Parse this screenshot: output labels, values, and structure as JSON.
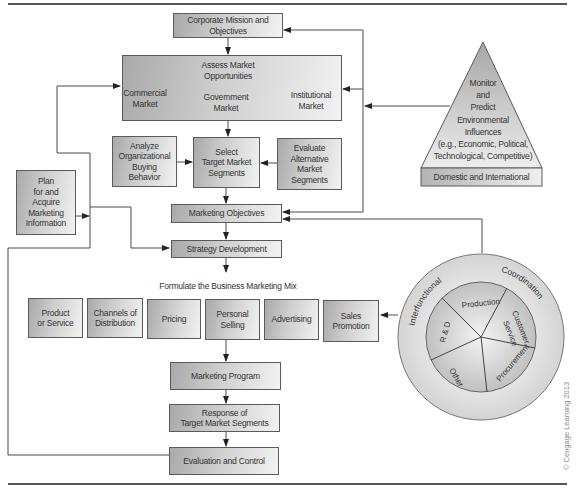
{
  "diagram": {
    "corporate_mission": [
      "Corporate Mission and",
      "Objectives"
    ],
    "assess_market": {
      "title": [
        "Assess Market",
        "Opportunities"
      ],
      "markets": [
        {
          "line1": "Commercial",
          "line2": "Market"
        },
        {
          "line1": "Government",
          "line2": "Market"
        },
        {
          "line1": "Institutional",
          "line2": "Market"
        }
      ]
    },
    "analyze_buying": [
      "Analyze",
      "Organizational",
      "Buying",
      "Behavior"
    ],
    "select_segments": [
      "Select",
      "Target Market",
      "Segments"
    ],
    "evaluate_segments": [
      "Evaluate",
      "Alternative",
      "Market",
      "Segments"
    ],
    "plan_info": [
      "Plan",
      "for and",
      "Acquire",
      "Marketing",
      "Information"
    ],
    "marketing_objectives": "Marketing Objectives",
    "strategy_development": "Strategy Development",
    "mix_heading": "Formulate the Business Marketing Mix",
    "mix_items": [
      [
        "Product",
        "or Service"
      ],
      [
        "Channels of",
        "Distribution"
      ],
      [
        "Pricing"
      ],
      [
        "Personal",
        "Selling"
      ],
      [
        "Advertising"
      ],
      [
        "Sales",
        "Promotion"
      ]
    ],
    "marketing_program": "Marketing Program",
    "response": [
      "Response of",
      "Target Market Segments"
    ],
    "evaluation": "Evaluation and Control",
    "environment": {
      "lines": [
        "Monitor",
        "and",
        "Predict",
        "Environmental",
        "Influences",
        "(e.g., Economic, Political,",
        "Technological, Competitive)"
      ],
      "base": "Domestic and International"
    },
    "coordination": {
      "ring_left": "Interfunctional",
      "ring_right": "Coordination",
      "slices": [
        "Production",
        "Customer",
        "Service",
        "Procurement",
        "Other",
        "R & D"
      ]
    },
    "copyright": "© Cengage Learning 2013"
  },
  "colors": {
    "line": "#4a4a4a",
    "box_border": "#5a5a5a",
    "box_dark": "#a9a9a9",
    "box_light": "#f2f2f2",
    "ring": "#d4d4d4",
    "pie": "#c4c4c4"
  }
}
